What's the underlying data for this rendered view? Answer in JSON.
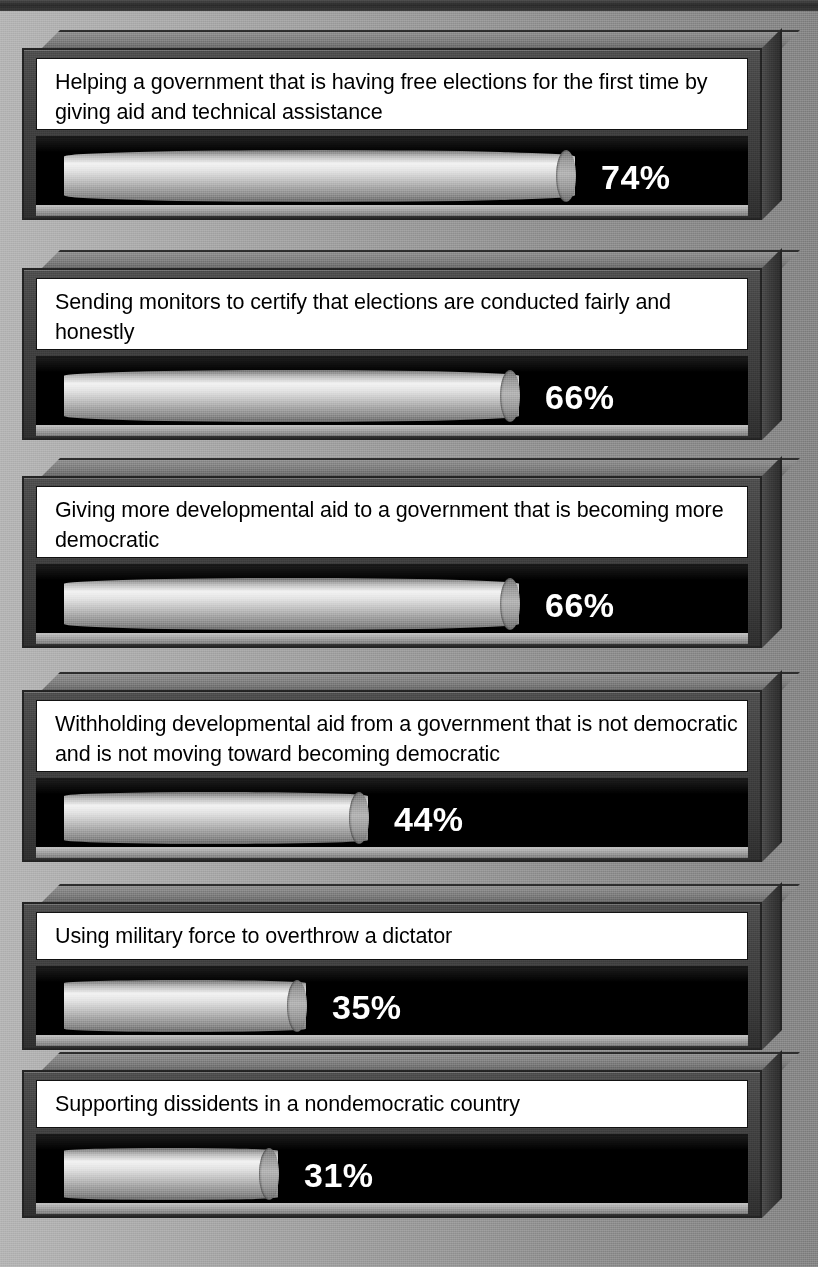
{
  "background": {
    "fill_left": "#b4b4b4",
    "fill_right": "#858585",
    "top_rule_color": "#2b2b2b"
  },
  "style": {
    "bar_fill_light": "#f2f2f2",
    "bar_fill_dark": "#6a6a6a",
    "well_color": "#000000",
    "plaque_color": "#ffffff",
    "pct_text_color": "#ffffff",
    "box_face_color": "#424242"
  },
  "chart_data": {
    "type": "bar",
    "title": "",
    "xlabel": "",
    "ylabel": "",
    "xlim": [
      0,
      100
    ],
    "grid": false,
    "legend": "none",
    "orientation": "horizontal",
    "value_suffix": "%",
    "categories": [
      "Helping a government that is having free elections for the first time by giving aid and technical assistance",
      "Sending monitors to certify that elections are conducted fairly and honestly",
      "Giving more developmental aid to a government that is becoming more democratic",
      "Withholding developmental aid from a government that is not democratic and is not moving toward becoming democratic",
      "Using military force to overthrow a dictator",
      "Supporting dissidents in a nondemocratic country"
    ],
    "values": [
      74,
      66,
      66,
      44,
      35,
      31
    ],
    "labels": [
      "74%",
      "66%",
      "66%",
      "44%",
      "35%",
      "31%"
    ]
  },
  "panels": [
    {
      "caption": "Helping a government that is having free elections for the first time by giving aid and technical assistance",
      "value": 74,
      "label": "74%",
      "lines": 2
    },
    {
      "caption": "Sending monitors to certify that elections are conducted fairly and honestly",
      "value": 66,
      "label": "66%",
      "lines": 2
    },
    {
      "caption": "Giving more developmental aid to a government that is becoming more democratic",
      "value": 66,
      "label": "66%",
      "lines": 2
    },
    {
      "caption": "Withholding developmental aid from a government that is not democratic and is not moving toward becoming democratic",
      "value": 44,
      "label": "44%",
      "lines": 2
    },
    {
      "caption": "Using military force to overthrow a dictator",
      "value": 35,
      "label": "35%",
      "lines": 1
    },
    {
      "caption": "Supporting dissidents in a nondemocratic country",
      "value": 31,
      "label": "31%",
      "lines": 1
    }
  ]
}
